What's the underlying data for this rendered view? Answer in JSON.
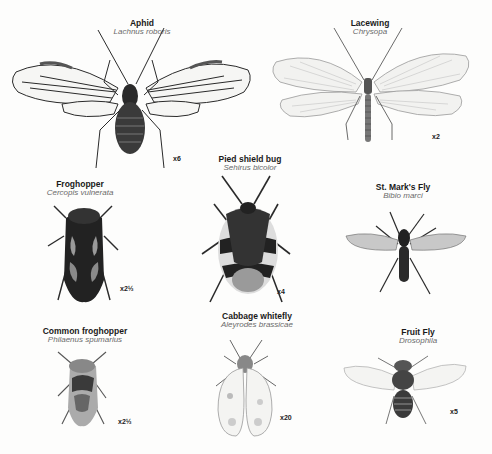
{
  "insects": [
    {
      "id": "aphid",
      "common": "Aphid",
      "scientific": "Lachnus roboris",
      "scale": "x6"
    },
    {
      "id": "lacewing",
      "common": "Lacewing",
      "scientific": "Chrysopa",
      "scale": "x2"
    },
    {
      "id": "pied-shield-bug",
      "common": "Pied shield bug",
      "scientific": "Sehirus bicolor",
      "scale": "x4"
    },
    {
      "id": "froghopper",
      "common": "Froghopper",
      "scientific": "Cercopis vulnerata",
      "scale": "x2½"
    },
    {
      "id": "st-marks-fly",
      "common": "St. Mark's Fly",
      "scientific": "Bibio marci",
      "scale": ""
    },
    {
      "id": "common-froghopper",
      "common": "Common froghopper",
      "scientific": "Philaenus spumarius",
      "scale": "x2½"
    },
    {
      "id": "cabbage-whitefly",
      "common": "Cabbage whitefly",
      "scientific": "Aleyrodes brassicae",
      "scale": "x20"
    },
    {
      "id": "fruit-fly",
      "common": "Fruit Fly",
      "scientific": "Drosophila",
      "scale": "x5"
    }
  ],
  "colors": {
    "ink": "#1a1a1a",
    "dark": "#2b2b2b",
    "mid": "#7a7a7a",
    "light": "#c8c8c8",
    "paper": "#fdfdfc"
  }
}
